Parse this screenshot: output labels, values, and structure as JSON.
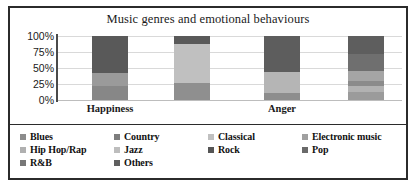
{
  "chart_data": {
    "type": "bar",
    "subtype": "stacked-percentage",
    "title": "Music genres and emotional behaviours",
    "xlabel": "",
    "ylabel": "",
    "ylim": [
      0,
      100
    ],
    "ytick_labels": [
      "100%",
      "75%",
      "50%",
      "25%",
      "0%"
    ],
    "ytick_values": [
      100,
      75,
      50,
      25,
      0
    ],
    "grid": true,
    "legend_position": "bottom",
    "categories": [
      "Happiness",
      "Anger"
    ],
    "bars": [
      {
        "group": "Happiness",
        "index": 0,
        "segments": [
          {
            "name": "Rock",
            "value": 58,
            "color": "#595959"
          },
          {
            "name": "Pop",
            "value": 20,
            "color": "#9a9a9a"
          },
          {
            "name": "Others",
            "value": 22,
            "color": "#878787"
          }
        ]
      },
      {
        "group": "Happiness",
        "index": 1,
        "segments": [
          {
            "name": "Rock",
            "value": 12,
            "color": "#595959"
          },
          {
            "name": "Classical",
            "value": 62,
            "color": "#c0c0c0"
          },
          {
            "name": "Others",
            "value": 26,
            "color": "#8f8f8f"
          }
        ]
      },
      {
        "group": "Anger",
        "index": 2,
        "segments": [
          {
            "name": "Rock",
            "value": 57,
            "color": "#5d5d5d"
          },
          {
            "name": "Pop",
            "value": 32,
            "color": "#b5b5b5"
          },
          {
            "name": "Others",
            "value": 11,
            "color": "#8d8d8d"
          }
        ]
      },
      {
        "group": "Anger",
        "index": 3,
        "segments": [
          {
            "name": "Rock",
            "value": 28,
            "color": "#5e5e5e"
          },
          {
            "name": "Electronic music",
            "value": 27,
            "color": "#6f6f6f"
          },
          {
            "name": "Pop",
            "value": 15,
            "color": "#a5a5a5"
          },
          {
            "name": "Hip Hop/Rap",
            "value": 8,
            "color": "#8b8b8b"
          },
          {
            "name": "Jazz",
            "value": 10,
            "color": "#b2b2b2"
          },
          {
            "name": "Others",
            "value": 12,
            "color": "#9b9b9b"
          }
        ]
      }
    ],
    "legend": [
      {
        "label": "Blues",
        "color": "#8c8c8c"
      },
      {
        "label": "Country",
        "color": "#7d7d7d"
      },
      {
        "label": "Classical",
        "color": "#c0c0c0"
      },
      {
        "label": "Electronic music",
        "color": "#a0a0a0"
      },
      {
        "label": "Hip Hop/Rap",
        "color": "#b0b0b0"
      },
      {
        "label": "Jazz",
        "color": "#bdbdbd"
      },
      {
        "label": "Rock",
        "color": "#555555"
      },
      {
        "label": "Pop",
        "color": "#6a6a6a"
      },
      {
        "label": "R&B",
        "color": "#777777"
      },
      {
        "label": "Others",
        "color": "#5f5f5f"
      }
    ]
  }
}
